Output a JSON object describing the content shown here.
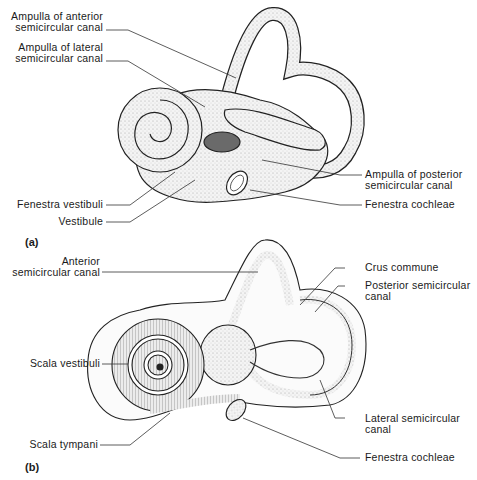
{
  "figure": {
    "panels": [
      {
        "id": "a",
        "label": "(a)",
        "labels": {
          "ampulla_anterior_l1": "Ampulla of anterior",
          "ampulla_anterior_l2": "semicircular canal",
          "ampulla_lateral_l1": "Ampulla of lateral",
          "ampulla_lateral_l2": "semicircular canal",
          "fenestra_vestibuli": "Fenestra vestibuli",
          "vestibule": "Vestibule",
          "ampulla_posterior_l1": "Ampulla of posterior",
          "ampulla_posterior_l2": "semicircular canal",
          "fenestra_cochleae": "Fenestra cochleae"
        }
      },
      {
        "id": "b",
        "label": "(b)",
        "labels": {
          "anterior_canal_l1": "Anterior",
          "anterior_canal_l2": "semicircular canal",
          "crus_commune": "Crus commune",
          "posterior_canal_l1": "Posterior semicircular",
          "posterior_canal_l2": "canal",
          "scala_vestibuli": "Scala vestibuli",
          "lateral_canal_l1": "Lateral semicircular",
          "lateral_canal_l2": "canal",
          "scala_tympani": "Scala tympani",
          "fenestra_cochleae": "Fenestra cochleae"
        }
      }
    ]
  }
}
